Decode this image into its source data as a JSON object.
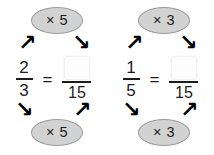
{
  "worksheet": {
    "title": "Equivalent fractions with multiplier arrows",
    "equals_symbol": "=",
    "problems": [
      {
        "id": "problem-1",
        "multiplier_top": "× 5",
        "multiplier_bottom": "× 5",
        "multiplier_value": "5",
        "fraction_numerator": "2",
        "fraction_denominator": "3",
        "answer_numerator": "",
        "answer_numerator_placeholder": "",
        "answer_denominator": "15",
        "arrow_top_left": "↗",
        "arrow_top_right": "↘",
        "arrow_bottom_left": "↘",
        "arrow_bottom_right": "↗"
      },
      {
        "id": "problem-2",
        "multiplier_top": "× 3",
        "multiplier_bottom": "× 3",
        "multiplier_value": "3",
        "fraction_numerator": "1",
        "fraction_denominator": "5",
        "answer_numerator": "",
        "answer_numerator_placeholder": "",
        "answer_denominator": "15",
        "arrow_top_left": "↗",
        "arrow_top_right": "↘",
        "arrow_bottom_left": "↘",
        "arrow_bottom_right": "↗"
      }
    ]
  },
  "colors": {
    "background": "#ffffff",
    "badge_fill": "#d2d2d2",
    "badge_border": "#9c9c9c",
    "text": "#1c1c1c",
    "arrow": "#000000",
    "answer_box_fill": "#fdfdfd"
  }
}
